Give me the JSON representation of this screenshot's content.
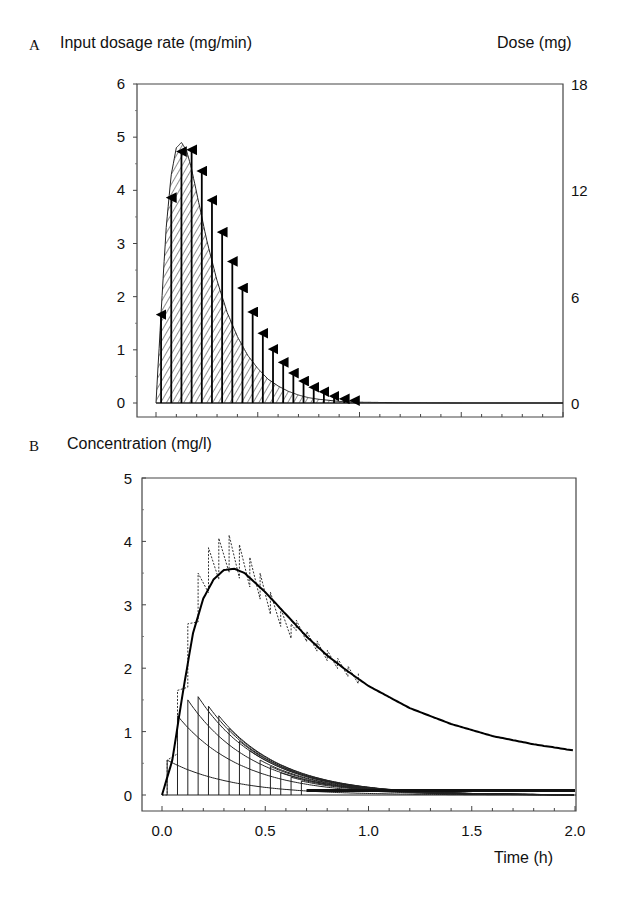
{
  "panel_a": {
    "letter": "A",
    "left_axis_title": "Input dosage rate (mg/min)",
    "right_axis_title": "Dose (mg)",
    "left_ticks": [
      "0",
      "1",
      "2",
      "3",
      "4",
      "5",
      "6"
    ],
    "right_ticks": [
      "0",
      "6",
      "12",
      "18"
    ]
  },
  "panel_b": {
    "letter": "B",
    "y_axis_title": "Concentration (mg/l)",
    "y_ticks": [
      "0",
      "1",
      "2",
      "3",
      "4",
      "5"
    ],
    "x_ticks": [
      "0.0",
      "0.5",
      "1.0",
      "1.5",
      "2.0"
    ],
    "x_axis_title": "Time (h)"
  },
  "chart_data": [
    {
      "type": "area",
      "title": "A",
      "xlabel": "Time (h)",
      "ylabel": "Input dosage rate (mg/min)",
      "y2label": "Dose (mg)",
      "xlim": [
        0,
        2.0
      ],
      "ylim": [
        0,
        6
      ],
      "y2lim": [
        0,
        18
      ],
      "grid": false,
      "series": [
        {
          "name": "Input dosage rate curve (hatched area)",
          "x": [
            0.0,
            0.025,
            0.05,
            0.075,
            0.1,
            0.125,
            0.15,
            0.175,
            0.2,
            0.225,
            0.25,
            0.3,
            0.35,
            0.4,
            0.45,
            0.5,
            0.55,
            0.6,
            0.65,
            0.7,
            0.75,
            0.8,
            0.9,
            1.0,
            1.2,
            1.5,
            2.0
          ],
          "values": [
            0.0,
            1.7,
            3.3,
            4.3,
            4.8,
            4.9,
            4.75,
            4.4,
            3.95,
            3.5,
            3.05,
            2.3,
            1.7,
            1.25,
            0.9,
            0.65,
            0.45,
            0.32,
            0.22,
            0.15,
            0.1,
            0.07,
            0.03,
            0.015,
            0.005,
            0.0,
            0.0
          ]
        },
        {
          "name": "Discrete doses (arrows, mg)",
          "x": [
            0.025,
            0.075,
            0.125,
            0.175,
            0.225,
            0.275,
            0.325,
            0.375,
            0.425,
            0.475,
            0.525,
            0.575,
            0.625,
            0.675,
            0.725,
            0.775,
            0.825,
            0.875,
            0.925,
            0.975
          ],
          "values": [
            5.1,
            11.7,
            14.3,
            14.4,
            13.2,
            11.55,
            9.75,
            8.1,
            6.6,
            5.25,
            4.05,
            3.15,
            2.4,
            1.8,
            1.35,
            1.0,
            0.75,
            0.5,
            0.35,
            0.25
          ]
        }
      ]
    },
    {
      "type": "line",
      "title": "B",
      "xlabel": "Time (h)",
      "ylabel": "Concentration (mg/l)",
      "xlim": [
        -0.1,
        2.0
      ],
      "ylim": [
        -0.2,
        5
      ],
      "x_ticks": [
        0.0,
        0.5,
        1.0,
        1.5,
        2.0
      ],
      "y_ticks": [
        0,
        1,
        2,
        3,
        4,
        5
      ],
      "grid": false,
      "series": [
        {
          "name": "Concentration (continuous input, solid)",
          "x": [
            0.0,
            0.05,
            0.1,
            0.15,
            0.2,
            0.25,
            0.3,
            0.35,
            0.4,
            0.5,
            0.6,
            0.7,
            0.8,
            0.9,
            1.0,
            1.2,
            1.4,
            1.6,
            1.8,
            2.0
          ],
          "values": [
            0.0,
            0.55,
            1.6,
            2.55,
            3.1,
            3.4,
            3.55,
            3.57,
            3.5,
            3.2,
            2.85,
            2.5,
            2.2,
            1.95,
            1.72,
            1.37,
            1.12,
            0.93,
            0.8,
            0.7
          ]
        },
        {
          "name": "Concentration (discrete doses, dotted sawtooth) peaks",
          "x": [
            0.025,
            0.075,
            0.125,
            0.175,
            0.225,
            0.275,
            0.325,
            0.375,
            0.425,
            0.475,
            0.525,
            0.575,
            0.625
          ],
          "values": [
            0.55,
            1.65,
            2.7,
            3.5,
            3.9,
            4.05,
            4.1,
            3.95,
            3.75,
            3.5,
            3.2,
            2.95,
            2.7
          ]
        },
        {
          "name": "Individual dose responses (peaks)",
          "x": [
            0.025,
            0.075,
            0.125,
            0.175,
            0.225,
            0.275,
            0.325,
            0.375,
            0.425,
            0.475,
            0.525,
            0.575,
            0.625,
            0.675
          ],
          "values": [
            0.55,
            1.25,
            1.5,
            1.55,
            1.4,
            1.25,
            1.05,
            0.85,
            0.7,
            0.55,
            0.45,
            0.35,
            0.28,
            0.22
          ]
        }
      ]
    }
  ]
}
